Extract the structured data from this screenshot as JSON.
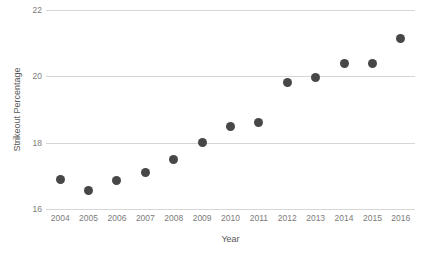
{
  "chart_data": {
    "type": "scatter",
    "title": "",
    "xlabel": "Year",
    "ylabel": "Strikeout Percentage",
    "x": [
      2004,
      2005,
      2006,
      2007,
      2008,
      2009,
      2010,
      2011,
      2012,
      2013,
      2014,
      2015,
      2016
    ],
    "values": [
      16.9,
      16.55,
      16.85,
      17.1,
      17.5,
      18.0,
      18.5,
      18.6,
      19.8,
      19.95,
      20.4,
      20.4,
      21.15
    ],
    "xtick_labels": [
      "2004",
      "2005",
      "2006",
      "2007",
      "2008",
      "2009",
      "2010",
      "2011",
      "2012",
      "2013",
      "2014",
      "2015",
      "2016"
    ],
    "ytick_labels": [
      "16",
      "18",
      "20",
      "22"
    ],
    "yticks": [
      16,
      18,
      20,
      22
    ],
    "ylim": [
      16,
      22
    ],
    "xlim": [
      2003.5,
      2016.5
    ],
    "grid": "horizontal",
    "legend": "none",
    "marker_color": "#474747",
    "gridline_color": "#d6d6d6",
    "axis_text_color": "#7b7b7b",
    "label_text_color": "#555555",
    "background_color": "#ffffff"
  }
}
